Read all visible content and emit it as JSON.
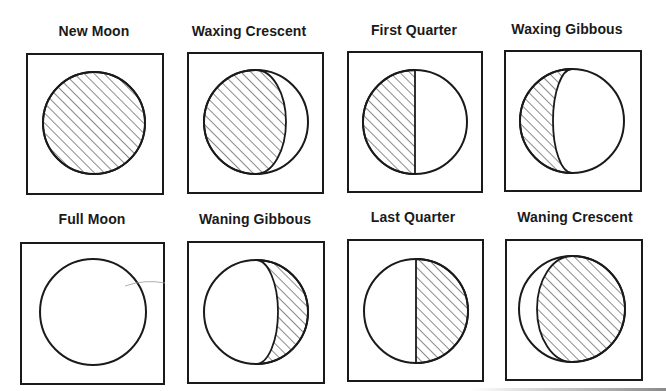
{
  "diagram": {
    "title": "",
    "colors": {
      "ink": "#1a1a1a",
      "background": "#ffffff",
      "hatch": "#2a2a2a"
    },
    "phases": [
      {
        "id": "new-moon",
        "label": "New Moon",
        "row": 0,
        "col": 0,
        "illuminated_side": "none",
        "illuminated_fraction": 0.0,
        "box": [
          27,
          54,
          136,
          140
        ],
        "label_pos": [
          94,
          36
        ],
        "circle": [
          94,
          123,
          51
        ],
        "shape": "new"
      },
      {
        "id": "waxing-crescent",
        "label": "Waxing Crescent",
        "row": 0,
        "col": 1,
        "illuminated_side": "right",
        "illuminated_fraction": 0.2,
        "box": [
          188,
          53,
          135,
          140
        ],
        "label_pos": [
          249,
          36
        ],
        "circle": [
          256,
          122,
          52
        ],
        "shape": "waxing-crescent",
        "terminator_x": 286
      },
      {
        "id": "first-quarter",
        "label": "First Quarter",
        "row": 0,
        "col": 2,
        "illuminated_side": "right",
        "illuminated_fraction": 0.5,
        "box": [
          348,
          52,
          134,
          140
        ],
        "label_pos": [
          414,
          35
        ],
        "circle": [
          415,
          122,
          52
        ],
        "shape": "first-quarter"
      },
      {
        "id": "waxing-gibbous",
        "label": "Waxing Gibbous",
        "row": 0,
        "col": 3,
        "illuminated_side": "right",
        "illuminated_fraction": 0.8,
        "box": [
          505,
          51,
          136,
          140
        ],
        "label_pos": [
          567,
          34
        ],
        "circle": [
          572,
          121,
          52
        ],
        "shape": "waxing-gibbous",
        "terminator_x": 553
      },
      {
        "id": "full-moon",
        "label": "Full Moon",
        "row": 1,
        "col": 0,
        "illuminated_side": "all",
        "illuminated_fraction": 1.0,
        "box": [
          21,
          243,
          143,
          141
        ],
        "label_pos": [
          92,
          224
        ],
        "circle": [
          93,
          312,
          53
        ],
        "shape": "full"
      },
      {
        "id": "waning-gibbous",
        "label": "Waning Gibbous",
        "row": 1,
        "col": 1,
        "illuminated_side": "left",
        "illuminated_fraction": 0.8,
        "box": [
          188,
          242,
          136,
          141
        ],
        "label_pos": [
          255,
          224
        ],
        "circle": [
          256,
          312,
          52
        ],
        "shape": "waning-gibbous",
        "terminator_x": 278
      },
      {
        "id": "last-quarter",
        "label": "Last Quarter",
        "row": 1,
        "col": 2,
        "illuminated_side": "left",
        "illuminated_fraction": 0.5,
        "box": [
          348,
          240,
          135,
          141
        ],
        "label_pos": [
          413,
          222
        ],
        "circle": [
          416,
          311,
          52
        ],
        "shape": "last-quarter"
      },
      {
        "id": "waning-crescent",
        "label": "Waning Crescent",
        "row": 1,
        "col": 3,
        "illuminated_side": "left",
        "illuminated_fraction": 0.2,
        "box": [
          506,
          240,
          136,
          140
        ],
        "label_pos": [
          575,
          222
        ],
        "circle": [
          572,
          309,
          53
        ],
        "shape": "waning-crescent",
        "terminator_x": 537
      }
    ],
    "legend": {
      "hatched": "dark (unlit) portion",
      "white": "lit portion"
    }
  }
}
